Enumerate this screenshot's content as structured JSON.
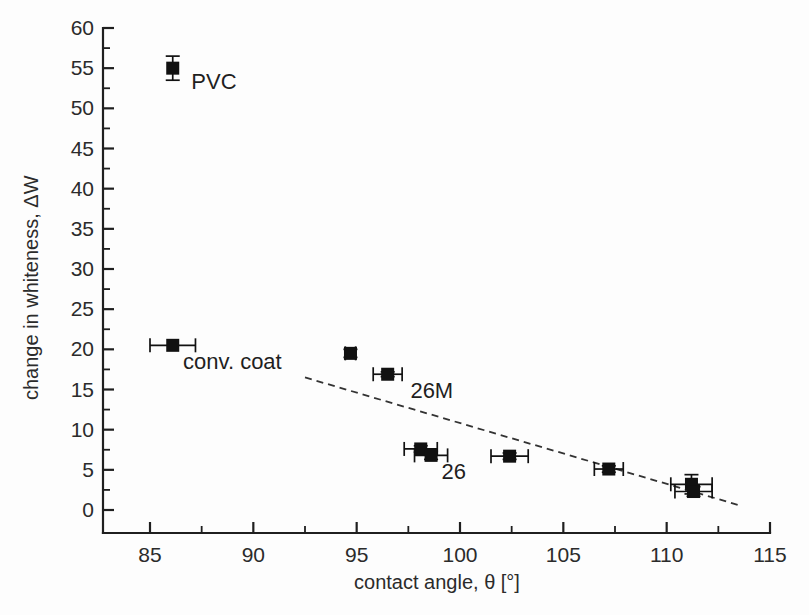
{
  "chart_data": {
    "type": "scatter",
    "title": "",
    "xlabel": "contact angle, θ [°]",
    "ylabel": "change in whiteness, ΔW",
    "xlim": [
      83,
      115
    ],
    "ylim": [
      0,
      60
    ],
    "x_major_ticks": [
      85,
      90,
      95,
      100,
      105,
      110,
      115
    ],
    "x_tick_labels": [
      "85",
      "90",
      "95",
      "100",
      "105",
      "110",
      "115"
    ],
    "x_minor_step": 2.5,
    "y_major_ticks": [
      0,
      5,
      10,
      15,
      20,
      25,
      30,
      35,
      40,
      45,
      50,
      55,
      60
    ],
    "y_tick_labels": [
      "0",
      "5",
      "10",
      "15",
      "20",
      "25",
      "30",
      "35",
      "40",
      "45",
      "50",
      "55",
      "60"
    ],
    "y_minor_step": 2.5,
    "grid": false,
    "legend": "none",
    "marker": "filled-square",
    "marker_color": "#111111",
    "points": [
      {
        "id": "pvc",
        "x": 86.1,
        "y": 55.0,
        "xerr": 0.0,
        "yerr": 1.5,
        "label": "PVC"
      },
      {
        "id": "conv-coat",
        "x": 86.1,
        "y": 20.5,
        "xerr": 1.1,
        "yerr": 0.0,
        "label": "conv. coat"
      },
      {
        "id": "p-94-7",
        "x": 94.7,
        "y": 19.5,
        "xerr": 0.25,
        "yerr": 0.5,
        "label": ""
      },
      {
        "id": "p-96-5",
        "x": 96.5,
        "y": 16.9,
        "xerr": 0.7,
        "yerr": 0.3,
        "label": "26M"
      },
      {
        "id": "p-98-1",
        "x": 98.1,
        "y": 7.6,
        "xerr": 0.8,
        "yerr": 0.4,
        "label": ""
      },
      {
        "id": "p-98-6",
        "x": 98.6,
        "y": 6.8,
        "xerr": 0.8,
        "yerr": 0.5,
        "label": "26"
      },
      {
        "id": "p-102-4",
        "x": 102.4,
        "y": 6.7,
        "xerr": 0.9,
        "yerr": 0.4,
        "label": ""
      },
      {
        "id": "p-107-2",
        "x": 107.2,
        "y": 5.1,
        "xerr": 0.7,
        "yerr": 0.4,
        "label": ""
      },
      {
        "id": "p-111-2a",
        "x": 111.2,
        "y": 3.2,
        "xerr": 1.0,
        "yerr": 1.2,
        "label": ""
      },
      {
        "id": "p-111-3b",
        "x": 111.3,
        "y": 2.3,
        "xerr": 0.9,
        "yerr": 0.6,
        "label": ""
      }
    ],
    "annotations": [
      {
        "id": "ann-pvc",
        "text": "PVC",
        "x": 87.0,
        "y": 52.4
      },
      {
        "id": "ann-conv-coat",
        "text": "conv. coat",
        "x": 86.6,
        "y": 17.5
      },
      {
        "id": "ann-26m",
        "text": "26M",
        "x": 97.6,
        "y": 14.0
      },
      {
        "id": "ann-26",
        "text": "26",
        "x": 99.1,
        "y": 3.8
      }
    ],
    "trend_line": {
      "id": "trend-dashed",
      "style": "dashed",
      "x_start": 92.5,
      "y_start": 16.5,
      "x_end": 113.5,
      "y_end": 0.6
    }
  }
}
